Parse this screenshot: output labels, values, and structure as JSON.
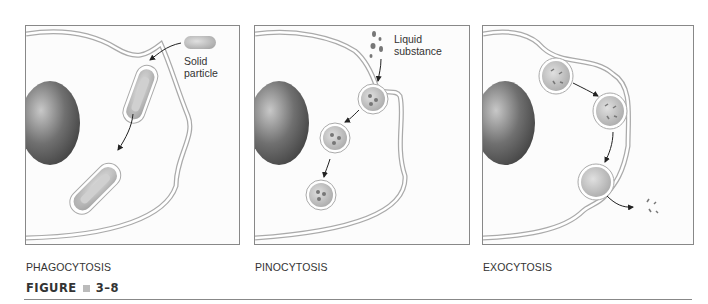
{
  "figure": {
    "label": "FIGURE",
    "number": "3–8"
  },
  "panels": [
    {
      "caption": "PHAGOCYTOSIS",
      "annotation_line1": "Solid",
      "annotation_line2": "particle"
    },
    {
      "caption": "PINOCYTOSIS",
      "annotation_line1": "Liquid",
      "annotation_line2": "substance"
    },
    {
      "caption": "EXOCYTOSIS"
    }
  ],
  "colors": {
    "nucleus": "#555555",
    "membrane": "#9a9a9a",
    "vesicle_fill": "#bdbdbd",
    "panel_border": "#888888"
  }
}
